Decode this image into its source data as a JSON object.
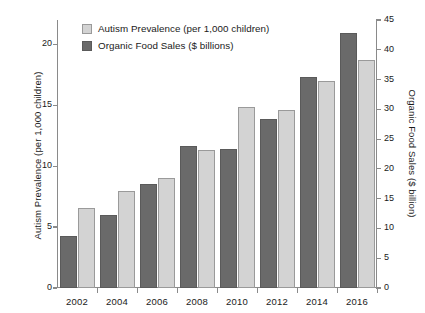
{
  "chart_data": {
    "type": "bar",
    "title": "",
    "subtitle": "",
    "xlabel": "",
    "ylabel": "Autism Prevalence (per 1,000 children)",
    "ylabel_secondary": "Organic Food Sales ($ billion)",
    "categories": [
      "2002",
      "2004",
      "2006",
      "2008",
      "2010",
      "2012",
      "2014",
      "2016"
    ],
    "grid": false,
    "legend_position": "top-left",
    "ylim": [
      0,
      22
    ],
    "ylim_secondary": [
      0,
      45
    ],
    "yticks": [
      "0",
      "5",
      "10",
      "15",
      "20"
    ],
    "ytick_values": [
      0,
      5,
      10,
      15,
      20
    ],
    "yticks_secondary": [
      "0",
      "5",
      "10",
      "15",
      "20",
      "25",
      "30",
      "35",
      "40",
      "45"
    ],
    "ytick_values_secondary": [
      0,
      5,
      10,
      15,
      20,
      25,
      30,
      35,
      40,
      45
    ],
    "series": [
      {
        "name": "Organic Food Sales ($ billions)",
        "axis": "right",
        "color": "#6a6a6a",
        "values": [
          8.8,
          12.2,
          17.4,
          23.9,
          23.3,
          28.3,
          35.5,
          42.9
        ]
      },
      {
        "name": "Autism Prevalence (per 1,000 children)",
        "axis": "left",
        "color": "#d3d3d3",
        "values": [
          6.6,
          8.0,
          9.0,
          11.3,
          14.9,
          14.6,
          17.0,
          18.7
        ]
      }
    ]
  },
  "legend": {
    "items": [
      {
        "label": "Autism Prevalence (per 1,000 children)",
        "swatch": "light"
      },
      {
        "label": "Organic Food Sales ($ billions)",
        "swatch": "dark"
      }
    ]
  },
  "colors": {
    "dark_bar": "#6a6a6a",
    "light_bar": "#d3d3d3",
    "axis": "#8a8a8a",
    "text": "#1a1a1a",
    "background": "#ffffff"
  }
}
